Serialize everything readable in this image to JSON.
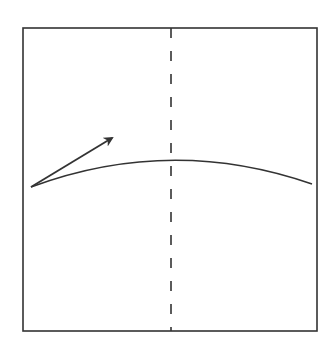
{
  "diagram": {
    "colors": {
      "background": "#ffffff",
      "stroke": "#333333"
    },
    "frame": {
      "x": 23,
      "y": 28,
      "width": 294,
      "height": 303
    },
    "center_line": {
      "x": 171,
      "y1": 28,
      "y2": 331,
      "style": "dashed"
    },
    "curve": {
      "start": [
        31,
        187
      ],
      "peak": [
        171,
        161
      ],
      "end": [
        312,
        184
      ]
    },
    "arrow": {
      "from": [
        31,
        187
      ],
      "to": [
        114,
        136
      ]
    }
  }
}
